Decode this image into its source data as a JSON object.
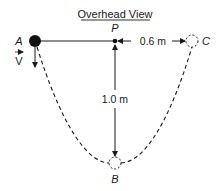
{
  "title": "Overhead View",
  "points": {
    "A": {
      "label": "A"
    },
    "P": {
      "label": "P"
    },
    "B": {
      "label": "B"
    },
    "C": {
      "label": "C"
    }
  },
  "velocity": {
    "label": "V"
  },
  "dimensions": {
    "horizontal": "0.6 m",
    "vertical": "1.0 m"
  },
  "colors": {
    "ink": "#1a1a1a",
    "background": "#ffffff"
  }
}
